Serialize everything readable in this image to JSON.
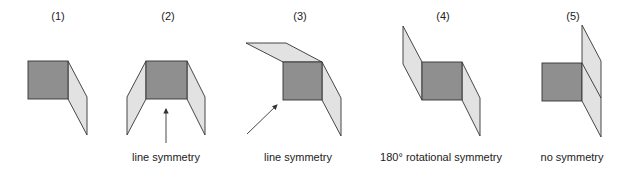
{
  "colors": {
    "square_fill": "#8f8f8f",
    "flap_fill": "#e2e2e2",
    "stroke": "#333333",
    "arrow": "#333333"
  },
  "figures": [
    {
      "number": "(1)",
      "label": ""
    },
    {
      "number": "(2)",
      "label": "line symmetry"
    },
    {
      "number": "(3)",
      "label": "line symmetry"
    },
    {
      "number": "(4)",
      "label": "180° rotational symmetry"
    },
    {
      "number": "(5)",
      "label": "no symmetry"
    }
  ]
}
